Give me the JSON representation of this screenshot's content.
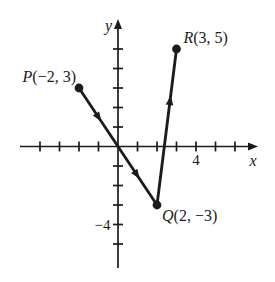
{
  "figure": {
    "colors": {
      "background": "#ffffff",
      "ink": "#1b1b1b"
    },
    "axes": {
      "x_label": "x",
      "y_label": "y",
      "x_ticks": [
        -4,
        -3,
        -2,
        -1,
        1,
        2,
        3,
        4,
        5,
        6
      ],
      "y_ticks": [
        1,
        2,
        3,
        4,
        5,
        -1,
        -2,
        -3,
        -4,
        -5
      ],
      "x_number_labels": [
        {
          "at": 4,
          "text": "4"
        }
      ],
      "y_number_labels": [
        {
          "at": -4,
          "text": "−4"
        }
      ]
    },
    "points": [
      {
        "id": "P",
        "x": -2,
        "y": 3,
        "letter": "P",
        "coords": "(−2, 3)"
      },
      {
        "id": "R",
        "x": 3,
        "y": 5,
        "letter": "R",
        "coords": "(3, 5)"
      },
      {
        "id": "Q",
        "x": 2,
        "y": -3,
        "letter": "Q",
        "coords": "(2, −3)"
      }
    ],
    "segments": [
      {
        "from": "P",
        "to": "Q",
        "arrow_fractions": [
          0.25,
          0.74
        ]
      },
      {
        "from": "Q",
        "to": "R",
        "arrow_fractions": [
          0.67
        ]
      }
    ]
  },
  "chart_data": {
    "type": "scatter",
    "points": [
      {
        "label": "P",
        "x": -2,
        "y": 3
      },
      {
        "label": "Q",
        "x": 2,
        "y": -3
      },
      {
        "label": "R",
        "x": 3,
        "y": 5
      }
    ],
    "segments": [
      [
        "P",
        "Q"
      ],
      [
        "Q",
        "R"
      ]
    ],
    "xlabel": "x",
    "ylabel": "y",
    "xlim": [
      -5,
      7
    ],
    "ylim": [
      -6.5,
      6.5
    ],
    "x_tick_labels_shown": [
      "4"
    ],
    "y_tick_labels_shown": [
      "−4"
    ],
    "grid": false
  }
}
